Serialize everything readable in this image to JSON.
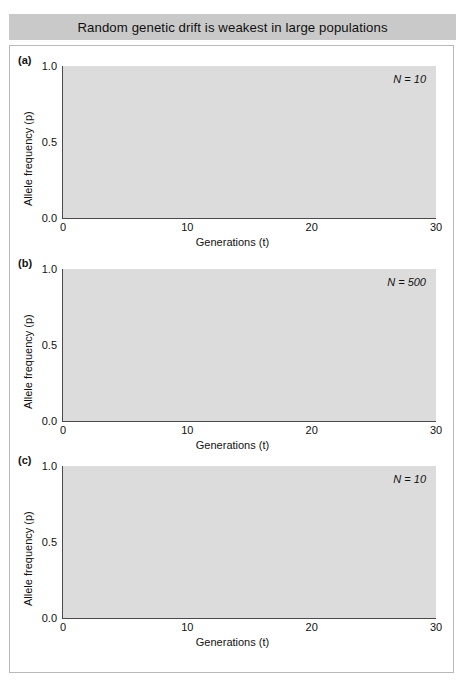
{
  "title": "Random genetic drift is weakest in large populations",
  "axes": {
    "xlabel": "Generations (t)",
    "ylabel": "Allele frequency (p)",
    "xticks": [
      "0",
      "10",
      "20",
      "30"
    ],
    "yticks": [
      "0.0",
      "0.5",
      "1.0"
    ],
    "xlim": [
      0,
      30
    ],
    "ylim": [
      0,
      1
    ]
  },
  "panels": [
    {
      "letter": "(a)",
      "annotation": "N = 10"
    },
    {
      "letter": "(b)",
      "annotation": "N = 500"
    },
    {
      "letter": "(c)",
      "annotation": "N = 10"
    }
  ],
  "colors": {
    "plot_background": "#dcdcdc",
    "gridline": "#ffffff",
    "title_background": "#c9c9c9",
    "axis": "#4a4a4a",
    "frame_border": "#b9b9b9"
  },
  "chart_data": [
    {
      "type": "line",
      "panel": "(a)",
      "title": "",
      "annotation": "N = 10",
      "xlabel": "Generations (t)",
      "ylabel": "Allele frequency (p)",
      "xlim": [
        0,
        30
      ],
      "ylim": [
        0,
        1
      ],
      "grid": true,
      "legend": "none",
      "x": [
        0,
        1,
        2,
        3,
        4,
        5,
        6,
        7,
        8,
        9,
        10,
        11,
        12,
        13,
        14,
        15,
        16,
        17,
        18,
        19,
        20,
        21,
        22,
        23,
        24,
        25,
        26,
        27,
        28,
        29,
        30
      ],
      "series": [
        {
          "name": "replicate-1",
          "color": "#4a4a4a",
          "values": [
            0.5,
            0.55,
            0.6,
            0.6,
            0.55,
            0.6,
            0.55,
            0.65,
            0.7,
            0.75,
            0.75,
            0.9,
            0.95,
            1.0,
            1.0,
            1.0,
            1.0,
            1.0,
            1.0,
            1.0,
            1.0,
            1.0,
            1.0,
            1.0,
            1.0,
            1.0,
            1.0,
            1.0,
            1.0,
            1.0,
            1.0
          ]
        },
        {
          "name": "replicate-2",
          "color": "#5a5a5a",
          "values": [
            0.5,
            0.6,
            0.65,
            0.6,
            0.6,
            0.65,
            0.6,
            0.55,
            0.6,
            0.6,
            0.6,
            0.75,
            0.9,
            0.92,
            0.95,
            0.98,
            1.0,
            1.0,
            1.0,
            1.0,
            1.0,
            1.0,
            1.0,
            1.0,
            1.0,
            1.0,
            1.0,
            1.0,
            1.0,
            1.0,
            1.0
          ]
        },
        {
          "name": "replicate-3",
          "color": "#6e6e6e",
          "values": [
            0.5,
            0.52,
            0.55,
            0.52,
            0.5,
            0.45,
            0.45,
            0.5,
            0.5,
            0.52,
            0.55,
            0.65,
            0.6,
            0.55,
            0.55,
            0.55,
            0.55,
            0.57,
            0.55,
            0.5,
            0.45,
            0.4,
            0.35,
            0.3,
            0.3,
            0.28,
            0.25,
            0.2,
            0.15,
            0.05,
            0.0
          ]
        },
        {
          "name": "replicate-4",
          "color": "#8a8a8a",
          "values": [
            0.5,
            0.5,
            0.5,
            0.45,
            0.45,
            0.45,
            0.4,
            0.38,
            0.35,
            0.33,
            0.32,
            0.33,
            0.33,
            0.33,
            0.33,
            0.35,
            0.33,
            0.3,
            0.32,
            0.33,
            0.32,
            0.3,
            0.28,
            0.28,
            0.28,
            0.35,
            0.43,
            0.47,
            0.47,
            0.72,
            0.75
          ]
        },
        {
          "name": "replicate-5",
          "color": "#9a9a9a",
          "values": [
            0.5,
            0.47,
            0.42,
            0.38,
            0.25,
            0.22,
            0.25,
            0.3,
            0.32,
            0.3,
            0.3,
            0.28,
            0.3,
            0.32,
            0.3,
            0.25,
            0.22,
            0.2,
            0.2,
            0.25,
            0.23,
            0.22,
            0.25,
            0.28,
            0.28,
            0.28,
            0.28,
            0.28,
            0.28,
            0.28,
            0.28
          ]
        },
        {
          "name": "replicate-6",
          "color": "#5f5f5f",
          "values": [
            0.5,
            0.45,
            0.42,
            0.35,
            0.22,
            0.25,
            0.3,
            0.28,
            0.2,
            0.1,
            0.05,
            0.02,
            0.0,
            0.0,
            0.0,
            0.0,
            0.0,
            0.0,
            0.0,
            0.0,
            0.0,
            0.0,
            0.0,
            0.0,
            0.0,
            0.0,
            0.0,
            0.0,
            0.0,
            0.0,
            0.0
          ]
        },
        {
          "name": "replicate-7",
          "color": "#757575",
          "values": [
            0.5,
            0.48,
            0.45,
            0.4,
            0.3,
            0.33,
            0.32,
            0.28,
            0.25,
            0.2,
            0.15,
            0.07,
            0.0,
            0.0,
            0.0,
            0.0,
            0.0,
            0.0,
            0.0,
            0.0,
            0.0,
            0.0,
            0.0,
            0.0,
            0.0,
            0.0,
            0.0,
            0.0,
            0.0,
            0.0,
            0.0
          ]
        }
      ]
    },
    {
      "type": "line",
      "panel": "(b)",
      "title": "",
      "annotation": "N = 500",
      "xlabel": "Generations (t)",
      "ylabel": "Allele frequency (p)",
      "xlim": [
        0,
        30
      ],
      "ylim": [
        0,
        1
      ],
      "grid": true,
      "legend": "none",
      "x": [
        0,
        1,
        2,
        3,
        4,
        5,
        6,
        7,
        8,
        9,
        10,
        11,
        12,
        13,
        14,
        15,
        16,
        17,
        18,
        19,
        20,
        21,
        22,
        23,
        24,
        25,
        26,
        27,
        28,
        29,
        30
      ],
      "series": [
        {
          "name": "replicate-1",
          "color": "#5a5a5a",
          "values": [
            0.5,
            0.51,
            0.53,
            0.56,
            0.58,
            0.59,
            0.58,
            0.57,
            0.58,
            0.59,
            0.6,
            0.62,
            0.63,
            0.62,
            0.61,
            0.62,
            0.63,
            0.62,
            0.6,
            0.61,
            0.6,
            0.61,
            0.62,
            0.63,
            0.62,
            0.63,
            0.63,
            0.64,
            0.64,
            0.64,
            0.64
          ]
        },
        {
          "name": "replicate-2",
          "color": "#6a6a6a",
          "values": [
            0.5,
            0.51,
            0.52,
            0.54,
            0.56,
            0.57,
            0.56,
            0.54,
            0.55,
            0.56,
            0.57,
            0.56,
            0.55,
            0.56,
            0.57,
            0.58,
            0.59,
            0.58,
            0.56,
            0.57,
            0.58,
            0.59,
            0.58,
            0.57,
            0.57,
            0.58,
            0.57,
            0.57,
            0.57,
            0.57,
            0.57
          ]
        },
        {
          "name": "replicate-3",
          "color": "#7d7d7d",
          "values": [
            0.5,
            0.5,
            0.51,
            0.52,
            0.53,
            0.54,
            0.56,
            0.55,
            0.53,
            0.52,
            0.52,
            0.53,
            0.54,
            0.53,
            0.52,
            0.53,
            0.54,
            0.53,
            0.51,
            0.5,
            0.5,
            0.51,
            0.5,
            0.5,
            0.49,
            0.52,
            0.51,
            0.51,
            0.51,
            0.51,
            0.51
          ]
        },
        {
          "name": "replicate-4",
          "color": "#8d8d8d",
          "values": [
            0.5,
            0.49,
            0.48,
            0.48,
            0.47,
            0.46,
            0.46,
            0.45,
            0.46,
            0.47,
            0.48,
            0.49,
            0.48,
            0.47,
            0.48,
            0.49,
            0.5,
            0.51,
            0.5,
            0.49,
            0.48,
            0.48,
            0.47,
            0.47,
            0.48,
            0.5,
            0.5,
            0.5,
            0.5,
            0.5,
            0.5
          ]
        },
        {
          "name": "replicate-5",
          "color": "#666666",
          "values": [
            0.5,
            0.5,
            0.51,
            0.52,
            0.5,
            0.49,
            0.48,
            0.48,
            0.49,
            0.5,
            0.51,
            0.5,
            0.49,
            0.48,
            0.48,
            0.49,
            0.5,
            0.51,
            0.49,
            0.48,
            0.47,
            0.47,
            0.46,
            0.46,
            0.45,
            0.45,
            0.44,
            0.44,
            0.43,
            0.43,
            0.42
          ]
        },
        {
          "name": "replicate-6",
          "color": "#555555",
          "values": [
            0.5,
            0.49,
            0.49,
            0.5,
            0.51,
            0.5,
            0.49,
            0.48,
            0.49,
            0.5,
            0.5,
            0.49,
            0.48,
            0.48,
            0.49,
            0.49,
            0.5,
            0.51,
            0.49,
            0.48,
            0.48,
            0.47,
            0.46,
            0.45,
            0.44,
            0.43,
            0.42,
            0.42,
            0.41,
            0.41,
            0.41
          ]
        },
        {
          "name": "replicate-7",
          "color": "#9b9b9b",
          "values": [
            0.5,
            0.5,
            0.49,
            0.48,
            0.47,
            0.46,
            0.46,
            0.45,
            0.45,
            0.46,
            0.47,
            0.47,
            0.47,
            0.47,
            0.47,
            0.48,
            0.49,
            0.48,
            0.47,
            0.47,
            0.47,
            0.47,
            0.47,
            0.48,
            0.49,
            0.51,
            0.51,
            0.51,
            0.51,
            0.51,
            0.51
          ]
        }
      ]
    },
    {
      "type": "line",
      "panel": "(c)",
      "title": "",
      "annotation": "N = 10",
      "xlabel": "Generations (t)",
      "ylabel": "Allele frequency (p)",
      "xlim": [
        0,
        30
      ],
      "ylim": [
        0,
        1
      ],
      "grid": true,
      "legend": "none",
      "x": [
        0,
        1,
        2,
        3,
        4,
        5,
        6,
        7,
        8,
        9,
        10,
        11,
        12,
        13,
        14,
        15,
        16,
        17,
        18,
        19,
        20,
        21,
        22,
        23,
        24,
        25,
        26,
        27,
        28,
        29,
        30
      ],
      "series": [
        {
          "name": "replicate-1",
          "color": "#555555",
          "values": [
            0.1,
            0.2,
            0.3,
            0.38,
            0.45,
            0.5,
            0.52,
            0.55,
            0.48,
            0.5,
            0.55,
            0.62,
            0.6,
            0.7,
            0.75,
            0.8,
            0.82,
            0.85,
            0.9,
            1.0,
            1.0,
            1.0,
            1.0,
            1.0,
            1.0,
            1.0,
            1.0,
            1.0,
            1.0,
            1.0,
            1.0
          ]
        },
        {
          "name": "replicate-2",
          "color": "#6a6a6a",
          "values": [
            0.1,
            0.25,
            0.42,
            0.38,
            0.38,
            0.3,
            0.25,
            0.2,
            0.22,
            0.3,
            0.42,
            0.4,
            0.38,
            0.3,
            0.22,
            0.1,
            0.02,
            0.0,
            0.0,
            0.0,
            0.0,
            0.0,
            0.0,
            0.0,
            0.0,
            0.0,
            0.0,
            0.0,
            0.0,
            0.0,
            0.0
          ]
        },
        {
          "name": "replicate-3",
          "color": "#7a7a7a",
          "values": [
            0.1,
            0.12,
            0.15,
            0.2,
            0.25,
            0.3,
            0.25,
            0.2,
            0.28,
            0.3,
            0.35,
            0.38,
            0.35,
            0.35,
            0.3,
            0.22,
            0.15,
            0.15,
            0.3,
            0.35,
            0.38,
            0.25,
            0.15,
            0.28,
            0.45,
            0.62,
            0.65,
            0.6,
            0.58,
            0.4,
            0.42
          ]
        },
        {
          "name": "replicate-4",
          "color": "#8c8c8c",
          "values": [
            0.1,
            0.15,
            0.2,
            0.25,
            0.28,
            0.22,
            0.18,
            0.12,
            0.05,
            0.1,
            0.15,
            0.2,
            0.25,
            0.2,
            0.1,
            0.05,
            0.0,
            0.0,
            0.0,
            0.0,
            0.0,
            0.0,
            0.0,
            0.0,
            0.0,
            0.0,
            0.0,
            0.0,
            0.0,
            0.0,
            0.0
          ]
        },
        {
          "name": "replicate-5",
          "color": "#4e4e4e",
          "values": [
            0.1,
            0.1,
            0.1,
            0.1,
            0.1,
            0.2,
            0.3,
            0.4,
            0.42,
            0.42,
            0.45,
            0.45,
            0.42,
            0.38,
            0.25,
            0.12,
            0.0,
            0.0,
            0.0,
            0.0,
            0.0,
            0.0,
            0.0,
            0.0,
            0.0,
            0.0,
            0.0,
            0.0,
            0.0,
            0.0,
            0.0
          ]
        },
        {
          "name": "replicate-6",
          "color": "#9a9a9a",
          "values": [
            0.1,
            0.08,
            0.1,
            0.18,
            0.25,
            0.22,
            0.2,
            0.15,
            0.1,
            0.1,
            0.08,
            0.12,
            0.18,
            0.2,
            0.15,
            0.08,
            0.0,
            0.0,
            0.0,
            0.0,
            0.0,
            0.0,
            0.0,
            0.0,
            0.0,
            0.0,
            0.0,
            0.0,
            0.0,
            0.0,
            0.0
          ]
        },
        {
          "name": "replicate-7",
          "color": "#707070",
          "values": [
            0.1,
            0.05,
            0.02,
            0.05,
            0.1,
            0.12,
            0.1,
            0.0,
            0.0,
            0.0,
            0.0,
            0.0,
            0.0,
            0.0,
            0.0,
            0.0,
            0.0,
            0.0,
            0.0,
            0.0,
            0.0,
            0.0,
            0.0,
            0.0,
            0.0,
            0.0,
            0.0,
            0.0,
            0.0,
            0.0,
            0.0
          ]
        },
        {
          "name": "replicate-8",
          "color": "#636363",
          "values": [
            0.1,
            0.06,
            0.03,
            0.0,
            0.0,
            0.0,
            0.0,
            0.0,
            0.0,
            0.0,
            0.0,
            0.0,
            0.0,
            0.0,
            0.0,
            0.0,
            0.0,
            0.0,
            0.0,
            0.0,
            0.0,
            0.0,
            0.0,
            0.0,
            0.0,
            0.0,
            0.0,
            0.0,
            0.0,
            0.0,
            0.0
          ]
        }
      ]
    }
  ]
}
